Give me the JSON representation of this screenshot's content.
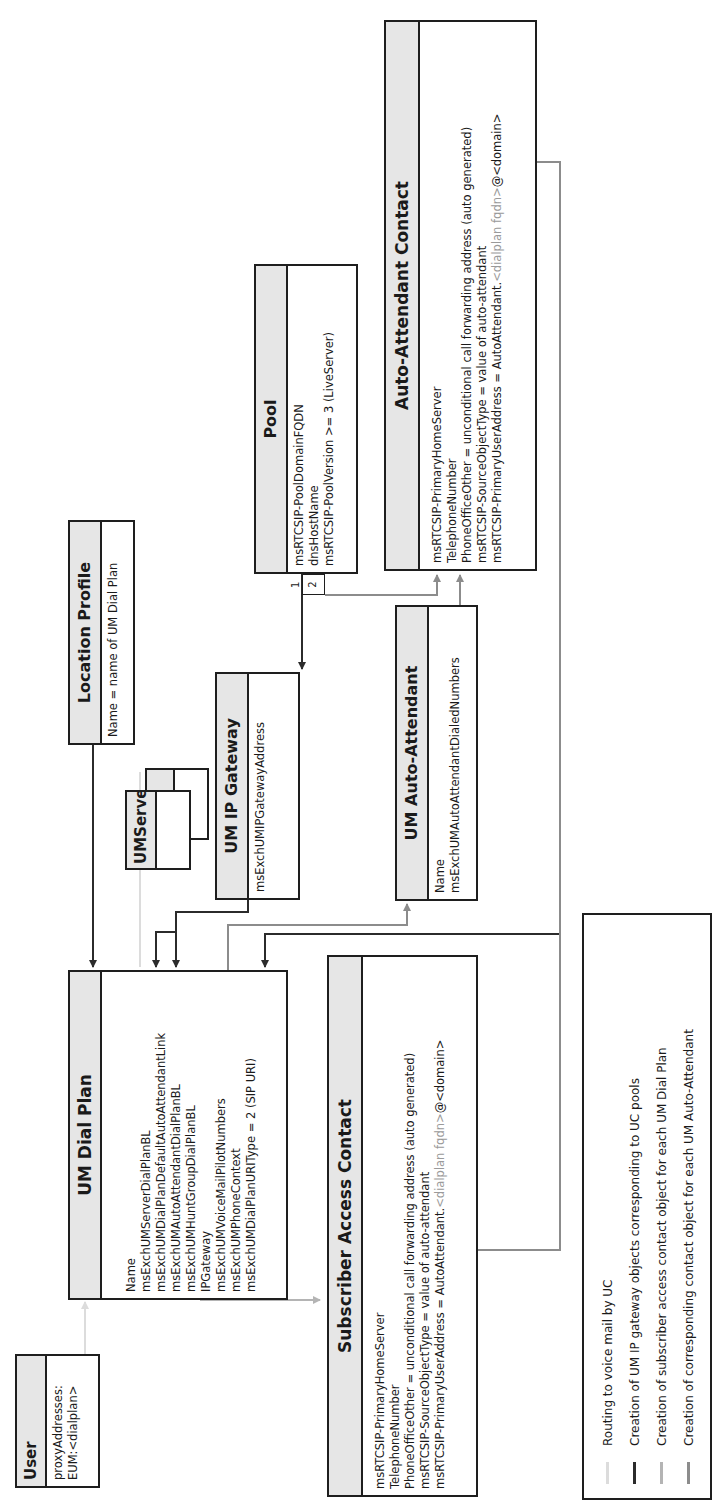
{
  "colors": {
    "routing_voicemail": "#dcdcdc",
    "gateway_creation": "#2b2b2b",
    "subscriber_access_creation": "#b4b4b4",
    "auto_attendant_creation": "#8c8c8c",
    "header_fill": "#e6e6e6",
    "border": "#1e1e1e"
  },
  "entities": {
    "user": {
      "title": "User",
      "attributes": [
        "proxyAddresses:",
        "EUM:<dialplan>"
      ]
    },
    "um_dial_plan": {
      "title": "UM Dial Plan",
      "attributes": [
        "Name",
        "msExchUMServerDialPlanBL",
        "msExchUMDialPlanDefaultAutoAttendantLink",
        "msExchUMAutoAttendantDialPlanBL",
        "msExchUMHuntGroupDialPlanBL",
        "IPGateway",
        "msExchUMVoiceMailPilotNumbers",
        "msExchUMPhoneContext",
        "msExchUMDialPlanURIType = 2 (SIP URI)"
      ]
    },
    "um_server": {
      "title": "UMServer",
      "back_title": "ver"
    },
    "location_profile": {
      "title": "Location Profile",
      "attributes": [
        "Name = name of UM Dial Plan"
      ]
    },
    "um_ip_gateway": {
      "title": "UM IP Gateway",
      "attributes": [
        "msExchUMIPGatewayAddress"
      ]
    },
    "pool": {
      "title": "Pool",
      "attributes": [
        "msRTCSIP-PoolDomainFQDN",
        "dnsHostName",
        "msRTCSIP-PoolVersion >= 3 (LiveServer)"
      ],
      "port_1": "1",
      "port_2": "2"
    },
    "um_auto_attendant": {
      "title": "UM Auto-Attendant",
      "attributes": [
        "Name",
        "msExchUMAutoAttendantDialedNumbers"
      ]
    },
    "auto_attendant_contact": {
      "title": "Auto-Attendant Contact",
      "attributes": [
        "msRTCSIP-PrimaryHomeServer",
        "TelephoneNumber",
        "PhoneOfficeOther = unconditional call forwarding address (auto generated)",
        "msRTCSIP-SourceObjectType = value of auto-attendant"
      ],
      "address_prefix": "msRTCSIP-PrimaryUserAddress = AutoAttendant.",
      "address_hint": "<dialplan fqdn>",
      "address_suffix": "@<domain>"
    },
    "subscriber_access_contact": {
      "title": "Subscriber Access Contact",
      "attributes": [
        "msRTCSIP-PrimaryHomeServer",
        "TelephoneNumber",
        "PhoneOfficeOther = unconditional call forwarding address (auto generated)",
        "msRTCSIP-SourceObjectType = value of auto-attendant"
      ],
      "address_prefix": "msRTCSIP-PrimaryUserAddress = AutoAttendant.",
      "address_hint": "<dialplan fqdn>",
      "address_suffix": "@<domain>"
    }
  },
  "legend": {
    "items": [
      {
        "label": "Routing to voice mail by UC",
        "style": "routing_voicemail"
      },
      {
        "label": "Creation of UM IP gateway objects corresponding to UC pools",
        "style": "gateway_creation"
      },
      {
        "label": "Creation of subscriber access contact object for each UM Dial Plan",
        "style": "subscriber_access_creation"
      },
      {
        "label": "Creation of corresponding contact object for each UM Auto-Attendant",
        "style": "auto_attendant_creation"
      }
    ]
  }
}
